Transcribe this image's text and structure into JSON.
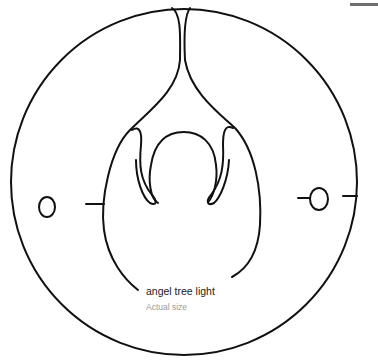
{
  "label": {
    "title": "angel tree light",
    "subtitle": "Actual size"
  },
  "colors": {
    "line": "#111111",
    "title_text": "#1a1a1a",
    "subtitle_text": "#9a9a9a",
    "corner_bar": "#6e6e6e",
    "background": "#ffffff"
  }
}
